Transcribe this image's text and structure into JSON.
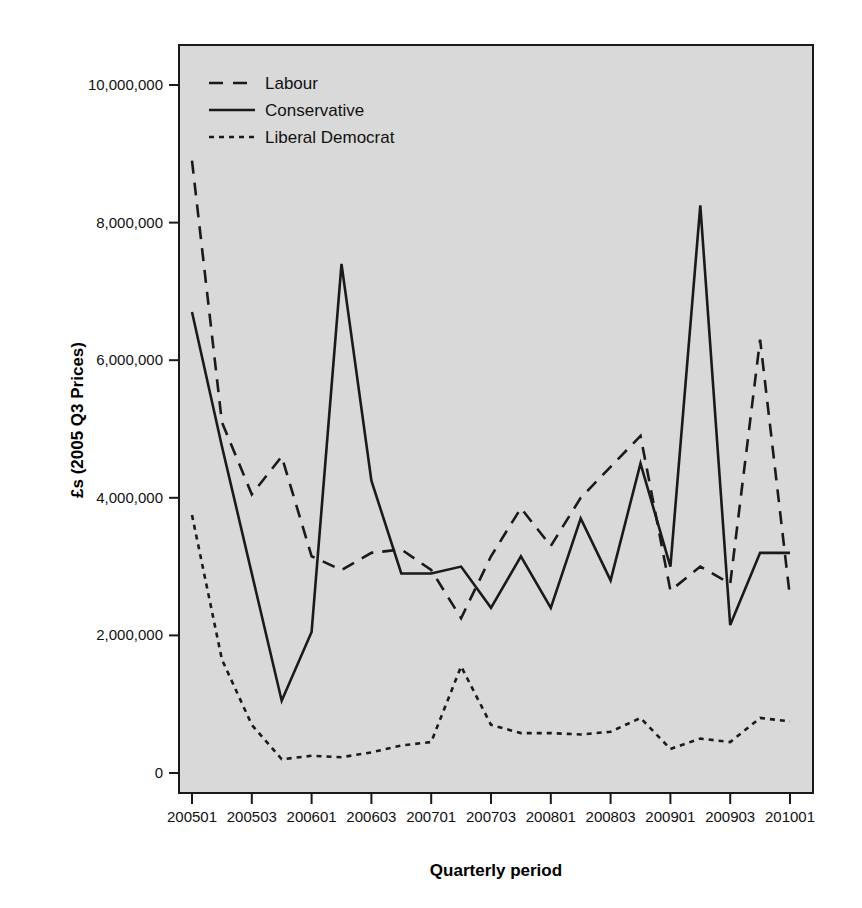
{
  "chart_data": {
    "type": "line",
    "title": "",
    "xlabel": "Quarterly period",
    "ylabel": "£s (2005 Q3 Prices)",
    "ylim": [
      -600000,
      10600000
    ],
    "yticks": [
      0,
      2000000,
      4000000,
      6000000,
      8000000,
      10000000
    ],
    "ytick_labels": [
      "0",
      "2,000,000",
      "4,000,000",
      "6,000,000",
      "8,000,000",
      "10,000,000"
    ],
    "grid": false,
    "legend_position": "top-left",
    "x": [
      "200501",
      "200502",
      "200503",
      "200504",
      "200601",
      "200602",
      "200603",
      "200604",
      "200701",
      "200702",
      "200703",
      "200704",
      "200801",
      "200802",
      "200803",
      "200804",
      "200901",
      "200902",
      "200903",
      "200904",
      "201001"
    ],
    "xtick_labels": [
      "200501",
      "200503",
      "200601",
      "200603",
      "200701",
      "200703",
      "200801",
      "200803",
      "200901",
      "200903",
      "201001"
    ],
    "xtick_values": [
      "200501",
      "200503",
      "200601",
      "200603",
      "200701",
      "200703",
      "200801",
      "200803",
      "200901",
      "200903",
      "201001"
    ],
    "series": [
      {
        "name": "Labour",
        "style": "dashed",
        "color": "#1a1a1a",
        "values": [
          8900000,
          5100000,
          4050000,
          4600000,
          3150000,
          2950000,
          3200000,
          3250000,
          2950000,
          2250000,
          3150000,
          3850000,
          3300000,
          4000000,
          4450000,
          4900000,
          2650000,
          3000000,
          2750000,
          6300000,
          2550000
        ]
      },
      {
        "name": "Conservative",
        "style": "solid",
        "color": "#1a1a1a",
        "values": [
          6700000,
          4750000,
          2900000,
          1050000,
          2050000,
          7400000,
          4250000,
          2900000,
          2900000,
          3000000,
          2400000,
          3150000,
          2400000,
          3700000,
          2800000,
          4500000,
          3000000,
          8250000,
          2150000,
          3200000,
          3200000
        ]
      },
      {
        "name": "Liberal Democrat",
        "style": "dotted",
        "color": "#1a1a1a",
        "values": [
          3750000,
          1650000,
          700000,
          200000,
          250000,
          230000,
          300000,
          400000,
          450000,
          1550000,
          700000,
          580000,
          580000,
          560000,
          600000,
          800000,
          350000,
          500000,
          450000,
          800000,
          750000
        ]
      }
    ],
    "series_detail_note": "21 quarterly points, 200501..201001"
  },
  "legend": {
    "items": [
      {
        "label": "Labour",
        "dash": "14 10"
      },
      {
        "label": "Conservative",
        "dash": "none"
      },
      {
        "label": "Liberal Democrat",
        "dash": "5 5"
      }
    ]
  },
  "colors": {
    "plot_background": "#d9d9d9",
    "page_background": "#ffffff",
    "line": "#1a1a1a",
    "axis": "#1a1a1a"
  }
}
